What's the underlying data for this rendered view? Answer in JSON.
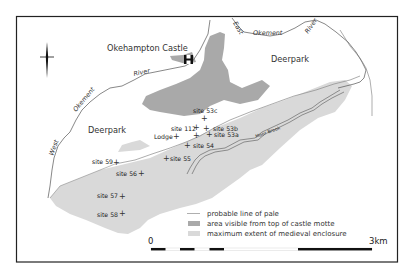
{
  "map": {
    "place_labels": {
      "castle": "Okehampton Castle",
      "deerpark_west": "Deerpark",
      "deerpark_east": "Deerpark"
    },
    "river_labels": {
      "okement_main_1": "Okement",
      "okement_main_2": "River",
      "west": "West",
      "east": "East",
      "east_okement": "Okement",
      "east_river": "River",
      "brook": "Moor Brook"
    },
    "sites": [
      {
        "id": "53c",
        "label": "site 53c"
      },
      {
        "id": "112",
        "label": "site 112"
      },
      {
        "id": "lodge",
        "label": "Lodge"
      },
      {
        "id": "53b",
        "label": "site 53b"
      },
      {
        "id": "53a",
        "label": "site 53a"
      },
      {
        "id": "54",
        "label": "site 54"
      },
      {
        "id": "55",
        "label": "site 55"
      },
      {
        "id": "59",
        "label": "site 59"
      },
      {
        "id": "56",
        "label": "site 56"
      },
      {
        "id": "57",
        "label": "site 57"
      },
      {
        "id": "58",
        "label": "site 58"
      }
    ],
    "legend": [
      {
        "symbol": "line",
        "label": "probable line of pale",
        "color": "#9a9a9a"
      },
      {
        "symbol": "swatch",
        "label": "area visible from top of castle motte",
        "color": "#a9a9a9"
      },
      {
        "symbol": "swatch",
        "label": "maximum extent of medieval enclosure",
        "color": "#d9d9d9"
      }
    ],
    "scale": {
      "start_label": "0",
      "end_label": "3km"
    },
    "colors": {
      "visible_area": "#a9a9a9",
      "enclosure": "#d9d9d9",
      "line": "#555555",
      "frame": "#222222"
    }
  }
}
